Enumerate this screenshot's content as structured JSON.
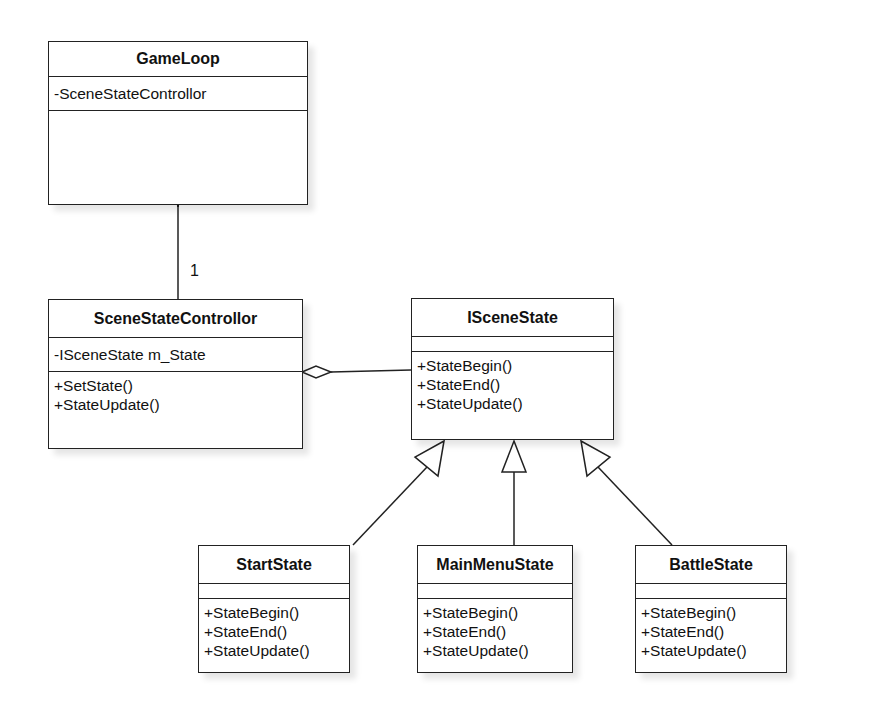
{
  "classes": {
    "gameloop": {
      "name": "GameLoop",
      "attributes": [
        "-SceneStateControllor"
      ],
      "operations": []
    },
    "controller": {
      "name": "SceneStateControllor",
      "attributes": [
        "-ISceneState m_State"
      ],
      "operations": [
        "+SetState()",
        "+StateUpdate()"
      ]
    },
    "iscenestate": {
      "name": "ISceneState",
      "attributes": [],
      "operations": [
        "+StateBegin()",
        "+StateEnd()",
        "+StateUpdate()"
      ]
    },
    "startstate": {
      "name": "StartState",
      "attributes": [],
      "operations": [
        "+StateBegin()",
        "+StateEnd()",
        "+StateUpdate()"
      ]
    },
    "mainmenustate": {
      "name": "MainMenuState",
      "attributes": [],
      "operations": [
        "+StateBegin()",
        "+StateEnd()",
        "+StateUpdate()"
      ]
    },
    "battlestate": {
      "name": "BattleState",
      "attributes": [],
      "operations": [
        "+StateBegin()",
        "+StateEnd()",
        "+StateUpdate()"
      ]
    }
  },
  "relations": [
    {
      "type": "composition",
      "from": "GameLoop",
      "to": "SceneStateControllor",
      "multiplicity": "1"
    },
    {
      "type": "aggregation",
      "from": "SceneStateControllor",
      "to": "ISceneState"
    },
    {
      "type": "generalization",
      "from": "StartState",
      "to": "ISceneState"
    },
    {
      "type": "generalization",
      "from": "MainMenuState",
      "to": "ISceneState"
    },
    {
      "type": "generalization",
      "from": "BattleState",
      "to": "ISceneState"
    }
  ],
  "labels": {
    "composition_multiplicity": "1"
  }
}
